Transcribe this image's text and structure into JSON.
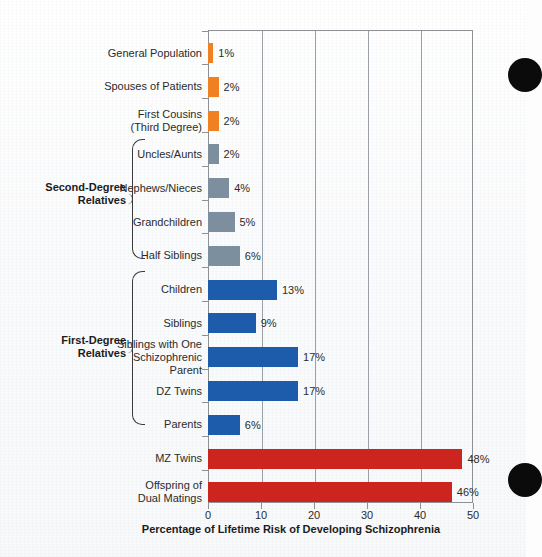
{
  "chart_data": {
    "type": "bar",
    "orientation": "horizontal",
    "title": "",
    "xlabel": "Percentage of Lifetime Risk of Developing Schizophrenia",
    "ylabel": "",
    "xlim": [
      0,
      50
    ],
    "xticks": [
      "0",
      "10",
      "20",
      "30",
      "40",
      "50"
    ],
    "grid": "vertical",
    "legend": "none",
    "categories": [
      "General Population",
      "Spouses of Patients",
      "First Cousins\n(Third Degree)",
      "Uncles/Aunts",
      "Nephews/Nieces",
      "Grandchildren",
      "Half Siblings",
      "Children",
      "Siblings",
      "Siblings with One\nSchizophrenic\nParent",
      "DZ Twins",
      "Parents",
      "MZ Twins",
      "Offspring of\nDual Matings"
    ],
    "values": [
      1,
      2,
      2,
      2,
      4,
      5,
      6,
      13,
      9,
      17,
      17,
      6,
      48,
      46
    ],
    "value_labels": [
      "1%",
      "2%",
      "2%",
      "2%",
      "4%",
      "5%",
      "6%",
      "13%",
      "9%",
      "17%",
      "17%",
      "6%",
      "48%",
      "46%"
    ],
    "colors": [
      "#ef8123",
      "#ef8123",
      "#ef8123",
      "#7d8f9f",
      "#7d8f9f",
      "#7d8f9f",
      "#7d8f9f",
      "#1d5bab",
      "#1d5bab",
      "#1d5bab",
      "#1d5bab",
      "#1d5bab",
      "#cc2520",
      "#cc2520"
    ],
    "color_groups": {
      "orange": "#ef8123",
      "gray": "#7d8f9f",
      "blue": "#1d5bab",
      "red": "#cc2520"
    },
    "groups": [
      {
        "label": "Second-Degree\nRelatives",
        "categories": [
          "Uncles/Aunts",
          "Nephews/Nieces",
          "Grandchildren",
          "Half Siblings"
        ]
      },
      {
        "label": "First-Degree\nRelatives",
        "categories": [
          "Children",
          "Siblings",
          "Siblings with One Schizophrenic Parent",
          "DZ Twins",
          "Parents"
        ]
      }
    ]
  }
}
